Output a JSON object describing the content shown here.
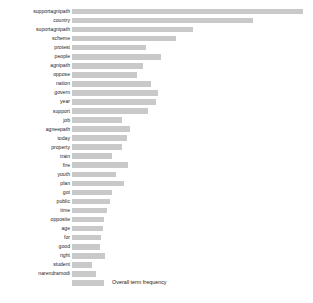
{
  "chart_data": {
    "type": "bar",
    "orientation": "horizontal",
    "title": "",
    "xlabel": "",
    "ylabel": "",
    "grid": false,
    "legend": {
      "position": "bottom-left",
      "entries": [
        "Overall term frequency"
      ]
    },
    "series": [
      {
        "name": "Overall term frequency",
        "color": "#c9c9c9",
        "values": [
          231,
          181,
          121,
          104,
          74,
          89,
          71,
          65,
          79,
          86,
          84,
          76,
          50,
          58,
          55,
          50,
          40,
          56,
          44,
          52,
          40,
          38,
          35,
          32,
          31,
          29,
          28,
          33,
          20,
          24
        ]
      }
    ],
    "categories": [
      "supportagnipath",
      "country",
      "suportagnipath",
      "scheme",
      "protest",
      "people",
      "agnipath",
      "oppose",
      "nation",
      "govern",
      "year",
      "support",
      "job",
      "agneepath",
      "today",
      "property",
      "train",
      "fire",
      "youth",
      "plan",
      "got",
      "public",
      "time",
      "opposite",
      "age",
      "for",
      "good",
      "right",
      "student",
      "narendramodi"
    ],
    "xlim": [
      0,
      231
    ],
    "bar_color": "#c9c9c9",
    "background_color": "#ffffff"
  },
  "legend": {
    "label": "Overall term frequency"
  }
}
